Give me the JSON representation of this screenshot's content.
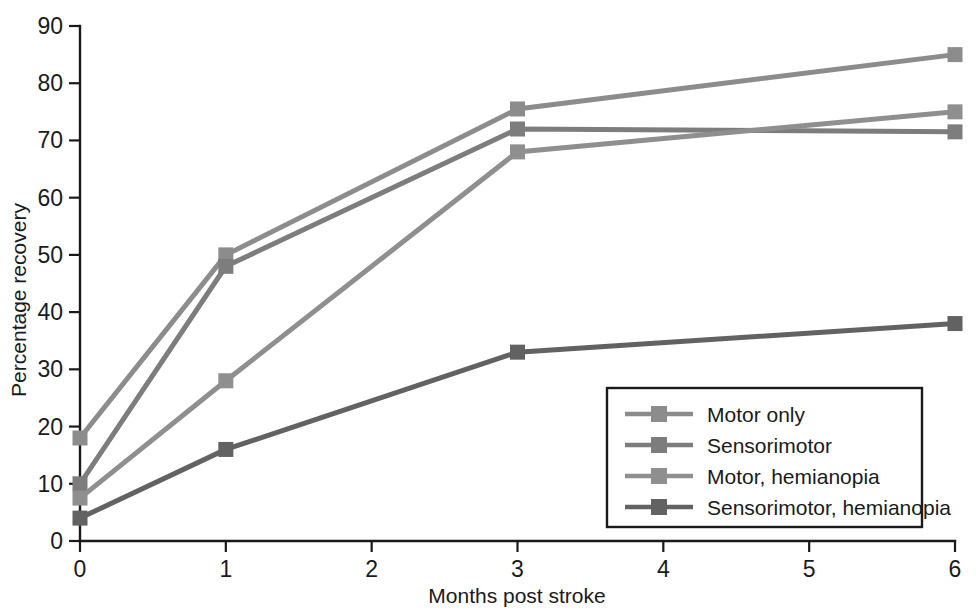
{
  "chart_data": {
    "type": "line",
    "title": "",
    "xlabel": "Months post stroke",
    "ylabel": "Percentage recovery",
    "x": [
      0,
      1,
      3,
      6
    ],
    "xticks": [
      "0",
      "1",
      "2",
      "3",
      "4",
      "5",
      "6"
    ],
    "xtick_values": [
      0,
      1,
      2,
      3,
      4,
      5,
      6
    ],
    "yticks": [
      "0",
      "10",
      "20",
      "30",
      "40",
      "50",
      "60",
      "70",
      "80",
      "90"
    ],
    "ytick_values": [
      0,
      10,
      20,
      30,
      40,
      50,
      60,
      70,
      80,
      90
    ],
    "xlim": [
      0,
      6
    ],
    "ylim": [
      0,
      90
    ],
    "grid": false,
    "legend_position": "lower-right",
    "marker": "square",
    "series": [
      {
        "name": "Motor only",
        "values": [
          18,
          50,
          75.5,
          85
        ],
        "color": "#8c8c8c"
      },
      {
        "name": "Sensorimotor",
        "values": [
          10,
          48,
          72,
          71.5
        ],
        "color": "#7d7d7d"
      },
      {
        "name": "Motor, hemianopia",
        "values": [
          7.5,
          28,
          68,
          75
        ],
        "color": "#8f8f8f"
      },
      {
        "name": "Sensorimotor, hemianopia",
        "values": [
          4,
          16,
          33,
          38
        ],
        "color": "#626262"
      }
    ]
  },
  "legend": {
    "entries": [
      {
        "label": "Motor only"
      },
      {
        "label": "Sensorimotor"
      },
      {
        "label": "Motor, hemianopia"
      },
      {
        "label": "Sensorimotor, hemianopia"
      }
    ]
  }
}
